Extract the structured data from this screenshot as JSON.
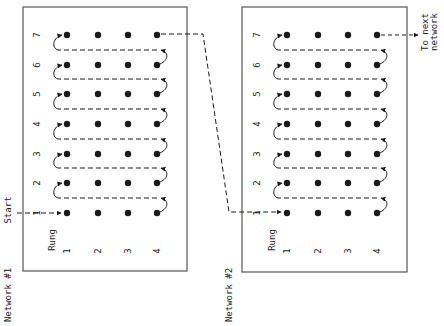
{
  "start_label": "Start",
  "next_label_line1": "To next",
  "next_label_line2": "network",
  "colors": {
    "ink": "#1a1a1a",
    "box": "#555555",
    "background": "#ffffff"
  },
  "networks": [
    {
      "name": "Network #1",
      "rung_header": "Rung",
      "rung_labels": [
        "1",
        "2",
        "3",
        "4",
        "5",
        "6",
        "7"
      ],
      "column_labels": [
        "1",
        "2",
        "3",
        "4"
      ]
    },
    {
      "name": "Network #2",
      "rung_header": "Rung",
      "rung_labels": [
        "1",
        "2",
        "3",
        "4",
        "5",
        "6",
        "7"
      ],
      "column_labels": [
        "1",
        "2",
        "3",
        "4"
      ]
    }
  ]
}
